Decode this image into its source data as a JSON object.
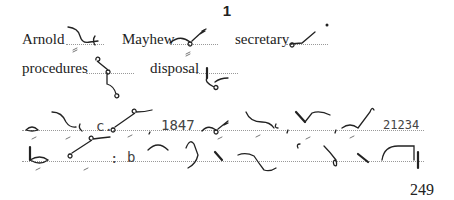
{
  "heading": "1",
  "vocabulary": [
    {
      "word": "Arnold"
    },
    {
      "word": "Mayhew"
    },
    {
      "word": "secretary"
    },
    {
      "word": "procedures"
    },
    {
      "word": "disposal"
    }
  ],
  "passage_numbers": {
    "abbrev": "c.",
    "year": "1847",
    "number": "21234",
    "colon": ":",
    "letter": "b"
  },
  "page_number": "249"
}
